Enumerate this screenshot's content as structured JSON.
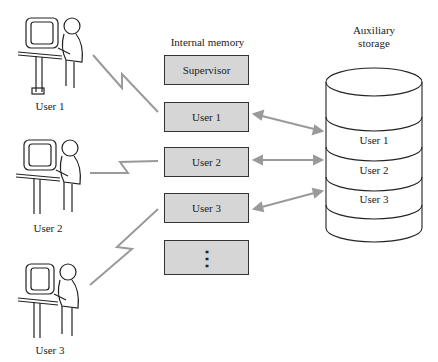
{
  "diagram": {
    "memory": {
      "title": "Internal memory",
      "blocks": [
        "Supervisor",
        "User 1",
        "User 2",
        "User 3",
        "⋮"
      ]
    },
    "storage": {
      "title_line1": "Auxiliary",
      "title_line2": "storage",
      "sections": [
        "User 1",
        "User 2",
        "User 3"
      ]
    },
    "terminals": [
      {
        "label": "User 1"
      },
      {
        "label": "User 2"
      },
      {
        "label": "User 3"
      }
    ],
    "colors": {
      "block_fill": "#d6d6d6",
      "link_line": "#9a9a9a",
      "outline": "#333333"
    }
  }
}
